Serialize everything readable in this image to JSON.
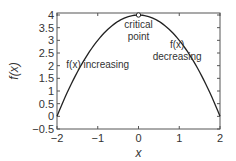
{
  "chart_data": {
    "type": "line",
    "title": "",
    "xlabel": "x",
    "ylabel": "f(x)",
    "xlim": [
      -2,
      2
    ],
    "ylim": [
      -0.5,
      4
    ],
    "xticks": [
      -2,
      -1,
      0,
      1,
      2
    ],
    "xtick_labels": [
      "−2",
      "−1",
      "0",
      "1",
      "2"
    ],
    "yticks": [
      -0.5,
      0,
      0.5,
      1,
      1.5,
      2,
      2.5,
      3,
      3.5,
      4
    ],
    "ytick_labels": [
      "−0.5",
      "0",
      "0.5",
      "1",
      "1.5",
      "2",
      "2.5",
      "3",
      "3.5",
      "4"
    ],
    "grid": false,
    "series": [
      {
        "name": "f(x) = 4 - x^2",
        "x": [
          -2,
          -1.5,
          -1,
          -0.5,
          0,
          0.5,
          1,
          1.5,
          2
        ],
        "y": [
          0,
          1.75,
          3,
          3.75,
          4,
          3.75,
          3,
          1.75,
          0
        ],
        "color": "#222222"
      }
    ],
    "marker": {
      "name": "critical point",
      "x": 0,
      "y": 4
    },
    "annotations": [
      {
        "text_lines": [
          "critical",
          "point"
        ],
        "x": 0,
        "y": 3.5
      },
      {
        "text_lines": [
          "f(x)",
          "decreasing"
        ],
        "x": 0.95,
        "y": 2.7
      },
      {
        "text_lines": [
          "f(x) increasing"
        ],
        "x": -1.0,
        "y": 1.9
      }
    ]
  }
}
